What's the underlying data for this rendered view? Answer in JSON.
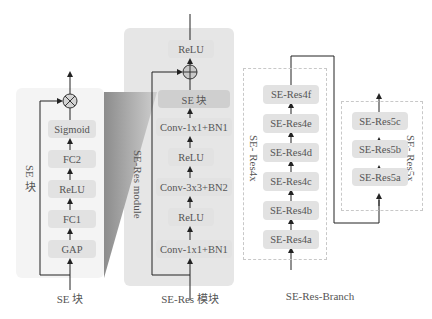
{
  "se_block": {
    "side_label": "SE 块",
    "layers": [
      "Sigmoid",
      "FC2",
      "ReLU",
      "FC1",
      "GAP"
    ],
    "combine_op": "multiply",
    "caption": "SE 块"
  },
  "se_res_module": {
    "side_label": "SE-Res module",
    "top_layer": "ReLU",
    "combine_op": "add",
    "layers": [
      "SE 块",
      "Conv-1x1+BN1",
      "ReLU",
      "Conv-3x3+BN2",
      "ReLU",
      "Conv-1x1+BN1"
    ],
    "caption": "SE-Res 模块"
  },
  "se_res_branch": {
    "group4": {
      "side_label": "SE- Res4x",
      "blocks": [
        "SE-Res4f",
        "SE-Res4e",
        "SE-Res4d",
        "SE-Res4c",
        "SE-Res4b",
        "SE-Res4a"
      ]
    },
    "group5": {
      "side_label": "SE- Res5x",
      "blocks": [
        "SE-Res5c",
        "SE-Res5b",
        "SE-Res5a"
      ]
    },
    "caption": "SE-Res-Branch"
  },
  "colors": {
    "panel_bg": "#f4f4f4",
    "panel_bg_dark": "#e6e6e6",
    "box_bg": "#e2e2e2",
    "line": "#333333",
    "wedge": "#9a9a9a"
  }
}
